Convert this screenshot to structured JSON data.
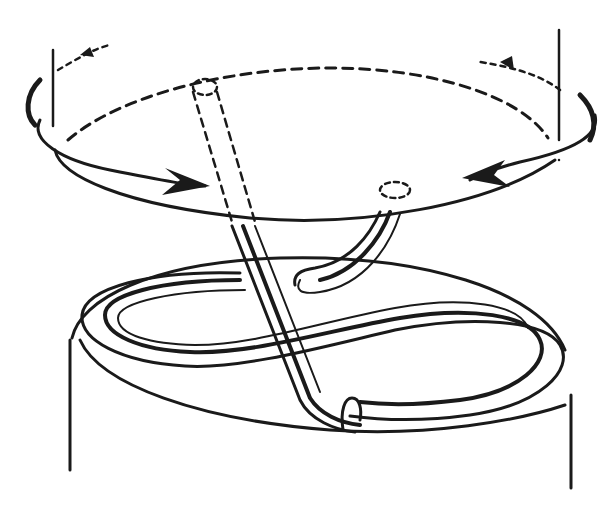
{
  "figure": {
    "colors": {
      "ink": "#1a1a1a",
      "background": "#ffffff"
    },
    "elements": [
      "rotating-disc",
      "rotation-arrows",
      "rotation-axis-lines",
      "tube-left",
      "tube-right",
      "figure-eight-loop",
      "cylinder",
      "clip-ring"
    ]
  }
}
